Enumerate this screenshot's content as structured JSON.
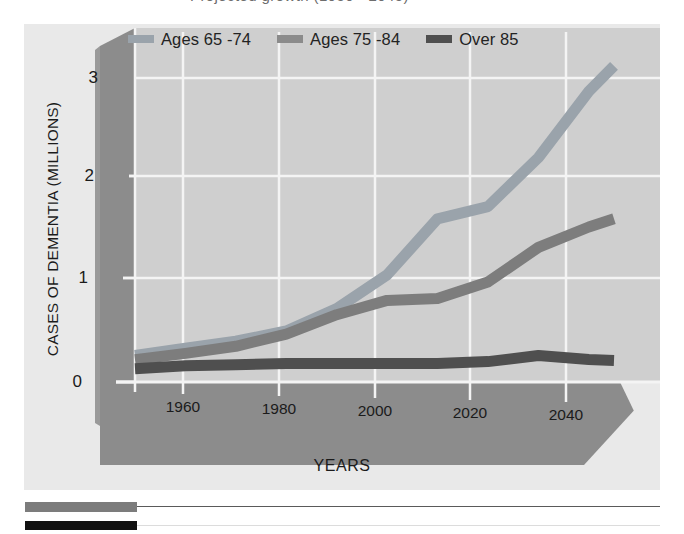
{
  "top_caption": {
    "text": "Projected growth (1950 - 2045)"
  },
  "figure": {
    "background_color": "#e9e9e9",
    "plot_background_color": "#cfcfcf",
    "wall_color": "#8c8c8c",
    "floor_color": "#8c8c8c",
    "gridline_color": "#f2f2f2"
  },
  "legend": {
    "position": "top",
    "items": [
      {
        "label": "Ages 65 -74",
        "color": "#9aa3ab"
      },
      {
        "label": "Ages 75 -84",
        "color": "#7d7d7d"
      },
      {
        "label": "Over 85",
        "color": "#4f4f4f"
      }
    ]
  },
  "axes": {
    "y_title": "CASES OF DEMENTIA (MILLIONS)",
    "x_title": "YEARS",
    "y_ticks": [
      "0",
      "1",
      "2",
      "3"
    ],
    "x_ticks": [
      "1960",
      "1980",
      "2000",
      "2020",
      "2040"
    ]
  },
  "decorations": {
    "rules": [
      {
        "block_color": "#7c7c7c",
        "line_color": "#5a5a5a"
      },
      {
        "block_color": "#111111",
        "line_color": "#d8d8d8"
      }
    ]
  },
  "chart_data": {
    "type": "line",
    "title": "Projected growth (1950 - 2045)",
    "xlabel": "YEARS",
    "ylabel": "CASES OF DEMENTIA (MILLIONS)",
    "xlim": [
      1950,
      2045
    ],
    "ylim": [
      0,
      3.2
    ],
    "grid": true,
    "legend_position": "top",
    "x": [
      1950,
      1960,
      1970,
      1980,
      1990,
      2000,
      2010,
      2020,
      2030,
      2040,
      2045
    ],
    "series": [
      {
        "name": "Ages 65 -74",
        "color": "#9aa3ab",
        "values": [
          0.26,
          0.33,
          0.4,
          0.5,
          0.72,
          1.05,
          1.6,
          1.72,
          2.2,
          2.85,
          3.1
        ]
      },
      {
        "name": "Ages 75 -84",
        "color": "#7d7d7d",
        "values": [
          0.22,
          0.28,
          0.35,
          0.47,
          0.66,
          0.8,
          0.82,
          0.98,
          1.32,
          1.52,
          1.6
        ]
      },
      {
        "name": "Over 85",
        "color": "#4f4f4f",
        "values": [
          0.13,
          0.16,
          0.17,
          0.18,
          0.18,
          0.18,
          0.18,
          0.2,
          0.26,
          0.22,
          0.21
        ]
      }
    ]
  }
}
